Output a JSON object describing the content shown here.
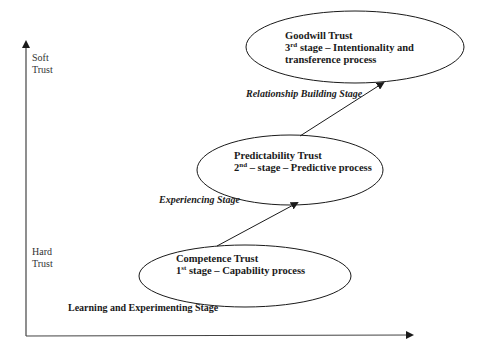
{
  "axes": {
    "y_top_label_line1": "Soft",
    "y_top_label_line2": "Trust",
    "y_bottom_label_line1": "Hard",
    "y_bottom_label_line2": "Trust"
  },
  "stages": [
    {
      "title": "Competence Trust",
      "ordinal_num": "1",
      "ordinal_suffix": "st",
      "description": " stage – Capability process",
      "transition_label": "Learning and Experimenting Stage"
    },
    {
      "title": "Predictability Trust",
      "ordinal_num": "2",
      "ordinal_suffix": "nd",
      "description": " – stage – Predictive process",
      "transition_label": "Experiencing Stage"
    },
    {
      "title": "Goodwill Trust",
      "ordinal_num": "3",
      "ordinal_suffix": "rd",
      "description": " stage – Intentionality and",
      "description_line2": "transference process",
      "transition_label": "Relationship Building Stage"
    }
  ],
  "colors": {
    "line": "#1a1a1a",
    "background": "#ffffff"
  }
}
